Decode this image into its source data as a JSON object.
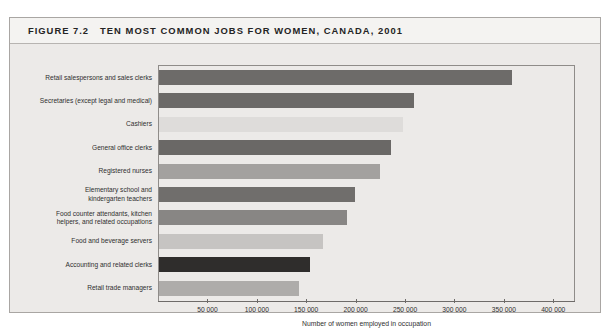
{
  "figure": {
    "number_label": "FIGURE 7.2",
    "title": "TEN MOST COMMON JOBS FOR WOMEN, CANADA, 2001"
  },
  "chart_data": {
    "type": "bar",
    "orientation": "horizontal",
    "title": "TEN MOST COMMON JOBS FOR WOMEN, CANADA, 2001",
    "xlabel": "Number of women employed in occupation",
    "ylabel": "",
    "xlim": [
      0,
      420000
    ],
    "grid": false,
    "legend": null,
    "tick_labels": [
      "50 000",
      "100 000",
      "150 000",
      "200 000",
      "250 000",
      "300 000",
      "350 000",
      "400 000"
    ],
    "tick_values": [
      50000,
      100000,
      150000,
      200000,
      250000,
      300000,
      350000,
      400000
    ],
    "categories": [
      "Retail salespersons and sales clerks",
      "Secretaries (except legal and medical)",
      "Cashiers",
      "General office clerks",
      "Registered nurses",
      "Elementary school and kindergarten teachers",
      "Food counter attendants, kitchen helpers, and related occupations",
      "Food and beverage servers",
      "Accounting and related clerks",
      "Retail trade managers"
    ],
    "category_lines": [
      [
        "Retail salespersons and sales clerks"
      ],
      [
        "Secretaries (except legal and medical)"
      ],
      [
        "Cashiers"
      ],
      [
        "General office clerks"
      ],
      [
        "Registered nurses"
      ],
      [
        "Elementary school and",
        "kindergarten teachers"
      ],
      [
        "Food counter attendants, kitchen",
        "helpers, and related occupations"
      ],
      [
        "Food and beverage servers"
      ],
      [
        "Accounting and related clerks"
      ],
      [
        "Retail trade managers"
      ]
    ],
    "values": [
      357000,
      258000,
      247000,
      235000,
      224000,
      198000,
      190000,
      166000,
      153000,
      142000
    ],
    "bar_colors": [
      "#6d6b69",
      "#6b6967",
      "#dedcda",
      "#6a6866",
      "#a3a19f",
      "#706e6c",
      "#888684",
      "#c6c4c2",
      "#2f2d2c",
      "#aeacaa"
    ]
  }
}
